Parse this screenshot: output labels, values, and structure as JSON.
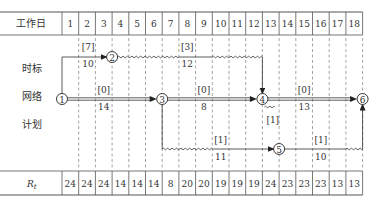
{
  "header": {
    "row_label": "工作日",
    "days": [
      "1",
      "2",
      "3",
      "4",
      "5",
      "6",
      "7",
      "8",
      "9",
      "10",
      "11",
      "12",
      "13",
      "14",
      "15",
      "16",
      "17",
      "18"
    ]
  },
  "side_labels": [
    "时标",
    "网络",
    "计划"
  ],
  "footer": {
    "row_label": "R",
    "row_label_sub": "t",
    "values": [
      "24",
      "24",
      "24",
      "14",
      "14",
      "14",
      "8",
      "20",
      "20",
      "19",
      "19",
      "19",
      "24",
      "23",
      "23",
      "23",
      "13",
      "13"
    ]
  },
  "nodes": [
    {
      "id": "1",
      "day": 0,
      "row": "main"
    },
    {
      "id": "2",
      "day": 3,
      "row": "top"
    },
    {
      "id": "3",
      "day": 6,
      "row": "main"
    },
    {
      "id": "4",
      "day": 12,
      "row": "main"
    },
    {
      "id": "5",
      "day": 13,
      "row": "bottom"
    },
    {
      "id": "6",
      "day": 18,
      "row": "main"
    }
  ],
  "activities": [
    {
      "from": "1",
      "to": "2",
      "resource": "[7]",
      "duration": "10",
      "label_day": 1.5,
      "critical": false
    },
    {
      "from": "2",
      "to": "4",
      "resource": "[3]",
      "duration": "12",
      "label_day": 7.5,
      "critical": false,
      "free_float_from_day": 3,
      "free_float_to_day": 12
    },
    {
      "from": "1",
      "to": "3",
      "resource": "[0]",
      "duration": "14",
      "label_day": 2.5,
      "critical": true
    },
    {
      "from": "3",
      "to": "4",
      "resource": "[0]",
      "duration": "8",
      "label_day": 8.5,
      "critical": true
    },
    {
      "from": "4",
      "to": "6",
      "resource": "[0]",
      "duration": "13",
      "label_day": 14.5,
      "critical": true
    },
    {
      "from": "3",
      "to": "5",
      "resource": "[1]",
      "duration": "11",
      "label_day": 9.5,
      "critical": false,
      "wavy_from_day": 6,
      "wavy_to_day": 9
    },
    {
      "from": "4",
      "to": "5",
      "resource": "[1]",
      "duration": "",
      "label_day": 12.5,
      "critical": false,
      "dummy": true
    },
    {
      "from": "5",
      "to": "6",
      "resource": "[1]",
      "duration": "10",
      "label_day": 15.5,
      "critical": false,
      "wavy_from_day": 17,
      "wavy_to_day": 18
    }
  ],
  "colors": {
    "line": "#333333",
    "grid": "#555555",
    "background": "#ffffff"
  }
}
